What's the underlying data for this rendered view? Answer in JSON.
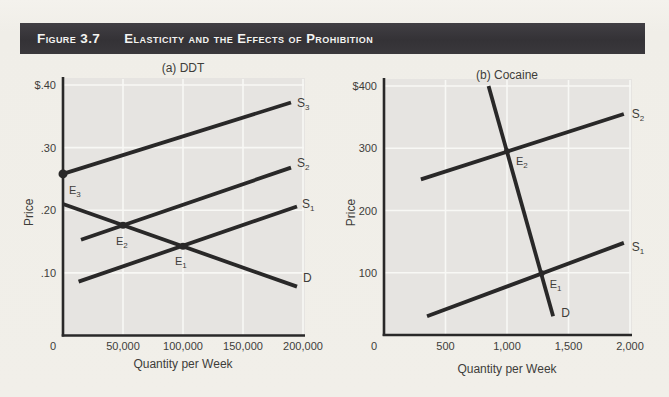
{
  "header": {
    "figure_label": "Figure 3.7",
    "title": "Elasticity and the Effects of Prohibition"
  },
  "colors": {
    "page_background": "#f1efe9",
    "header_bar": "#343236",
    "header_text": "#f4f4f2",
    "plot_background": "#e6e4e1",
    "gridline": "#f8f8f5",
    "curve_ink": "#292828",
    "label_text": "#3e3d3a"
  },
  "chart_data": [
    {
      "type": "line",
      "title": "(a) DDT",
      "xlabel": "Quantity per Week",
      "ylabel": "Price",
      "xlim": [
        0,
        200000
      ],
      "ylim": [
        0,
        0.4
      ],
      "grid": true,
      "legend_position": "line-end-labels",
      "xticks": [
        {
          "v": 0,
          "label": "0"
        },
        {
          "v": 50000,
          "label": "50,000"
        },
        {
          "v": 100000,
          "label": "100,000"
        },
        {
          "v": 150000,
          "label": "150,000"
        },
        {
          "v": 200000,
          "label": "200,000"
        }
      ],
      "yticks": [
        {
          "v": 0.1,
          "label": ".10"
        },
        {
          "v": 0.2,
          "label": ".20"
        },
        {
          "v": 0.3,
          "label": ".30"
        },
        {
          "v": 0.4,
          "label": "$.40"
        }
      ],
      "series": [
        {
          "name": "S_3",
          "role": "supply",
          "points": [
            [
              0,
              0.258
            ],
            [
              190000,
              0.372
            ]
          ],
          "label_offset": [
            6,
            4
          ]
        },
        {
          "name": "S_2",
          "role": "supply",
          "points": [
            [
              15000,
              0.153
            ],
            [
              190000,
              0.268
            ]
          ],
          "label_offset": [
            6,
            -1
          ]
        },
        {
          "name": "S_1",
          "role": "supply",
          "points": [
            [
              13000,
              0.086
            ],
            [
              195000,
              0.206
            ]
          ],
          "label_offset": [
            5,
            2
          ]
        },
        {
          "name": "D",
          "role": "demand",
          "points": [
            [
              0,
              0.21
            ],
            [
              195000,
              0.078
            ]
          ],
          "label_offset": [
            6,
            -5
          ]
        }
      ],
      "points": [
        {
          "name": "E_3",
          "x": 0,
          "y": 0.258,
          "r": 4.5,
          "label_offset": [
            6,
            20
          ]
        },
        {
          "name": "E_2",
          "x": 50000,
          "y": 0.176,
          "r": 3.5,
          "label_offset": [
            -7,
            20
          ]
        },
        {
          "name": "E_1",
          "x": 100000,
          "y": 0.1425,
          "r": 3.5,
          "label_offset": [
            -8,
            19
          ]
        }
      ]
    },
    {
      "type": "line",
      "title": "(b) Cocaine",
      "xlabel": "Quantity per Week",
      "ylabel": "Price",
      "xlim": [
        0,
        2000
      ],
      "ylim": [
        0,
        400
      ],
      "grid": true,
      "legend_position": "line-end-labels",
      "xticks": [
        {
          "v": 0,
          "label": "0"
        },
        {
          "v": 500,
          "label": "500"
        },
        {
          "v": 1000,
          "label": "1,000"
        },
        {
          "v": 1500,
          "label": "1,500"
        },
        {
          "v": 2000,
          "label": "2,000"
        }
      ],
      "yticks": [
        {
          "v": 100,
          "label": "100"
        },
        {
          "v": 200,
          "label": "200"
        },
        {
          "v": 300,
          "label": "300"
        },
        {
          "v": 400,
          "label": "$400"
        }
      ],
      "series": [
        {
          "name": "D",
          "role": "demand",
          "points": [
            [
              850,
              400
            ],
            [
              1375,
              30
            ]
          ],
          "label_offset": [
            8,
            1
          ]
        },
        {
          "name": "S_2",
          "role": "supply",
          "points": [
            [
              300,
              250
            ],
            [
              1950,
              355
            ]
          ],
          "label_offset": [
            8,
            4
          ]
        },
        {
          "name": "S_1",
          "role": "supply",
          "points": [
            [
              350,
              30
            ],
            [
              1950,
              148
            ]
          ],
          "label_offset": [
            8,
            8
          ]
        }
      ],
      "points": [
        {
          "name": "E_2",
          "x": 1000,
          "y": 295,
          "r": 3,
          "label_offset": [
            9,
            14
          ]
        },
        {
          "name": "E_1",
          "x": 1282,
          "y": 99,
          "r": 3,
          "label_offset": [
            8,
            15
          ]
        }
      ]
    }
  ]
}
